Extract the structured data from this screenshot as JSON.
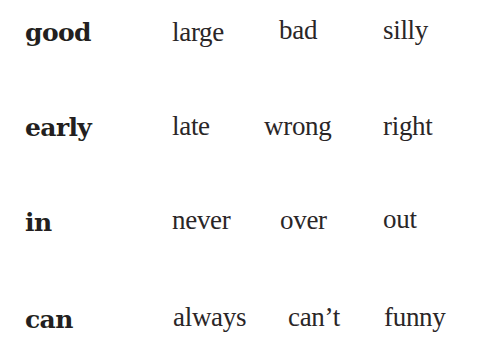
{
  "rows": [
    {
      "key": "good",
      "options": [
        "large",
        "bad",
        "silly"
      ]
    },
    {
      "key": "early",
      "options": [
        "late",
        "wrong",
        "right"
      ]
    },
    {
      "key": "in",
      "options": [
        "never",
        "over",
        "out"
      ]
    },
    {
      "key": "can",
      "options": [
        "always",
        "can’t",
        "funny"
      ]
    }
  ],
  "colors": {
    "text": "#231f20",
    "background": "#ffffff"
  }
}
